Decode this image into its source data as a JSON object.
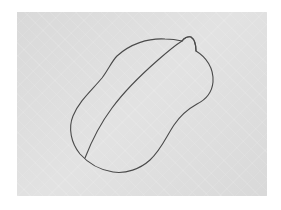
{
  "image": {
    "description": "Hand-drawn pencil sketch of a computer mouse outline on gray paper",
    "subject": "computer mouse sketch",
    "background_color": "#ffffff",
    "paper_color": "#d9d9d9",
    "stroke_color": "#4a4a4a"
  },
  "drawing": {
    "outer_outline": "M117,56 C130,44 148,38 165,39 C172,39 178,40 182,41 C184,38 188,36 191,37 C194,39 196,45 196,51 C206,57 214,68 213,82 C212,93 205,100 197,104 C188,109 180,116 174,125 C166,137 161,150 150,160 C140,169 126,174 113,172 C100,170 88,163 80,154 C71,143 68,128 73,116 C79,101 92,90 102,78 C108,70 112,61 117,56 Z",
    "bump": "M182,41 C184,38 188,36 191,37 C194,39 196,45 196,51",
    "center_line": "M85,158 C92,140 100,124 112,108 C126,89 142,74 158,60 C166,53 174,46 182,41"
  }
}
